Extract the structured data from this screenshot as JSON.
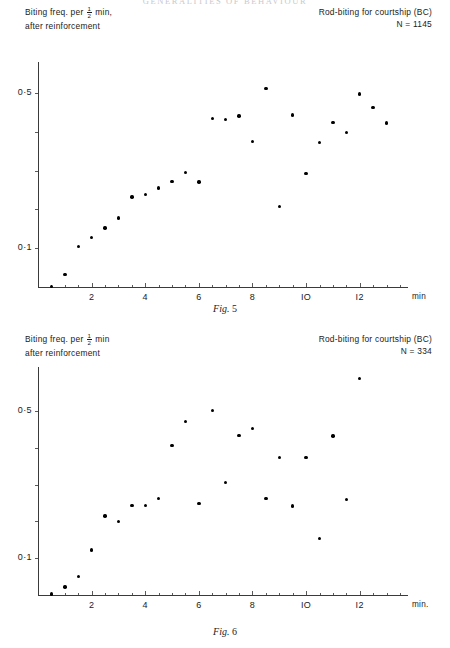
{
  "running_head": "GENERALITIES OF BEHAVIOUR",
  "figures": [
    {
      "id": "fig5",
      "caption_italic": "Fig.",
      "caption_number": "5",
      "header_left_line1_pre": "Biting freq. per",
      "header_left_line1_num": "1",
      "header_left_line1_den": "2",
      "header_left_line1_post": "min,",
      "header_left_line2": "after reinforcement",
      "header_right_line1": "Rod-biting for courtship (BC)",
      "header_right_line2": "N = 1145",
      "chart_data": {
        "type": "scatter",
        "title": "Rod-biting for courtship (BC)",
        "subtitle": "N = 1145",
        "ylabel": "Biting freq. per 1/2 min, after reinforcement",
        "xlabel": "min",
        "xlim": [
          0,
          13.8
        ],
        "ylim": [
          0,
          0.58
        ],
        "xticks": [
          2,
          4,
          6,
          8,
          10,
          12
        ],
        "xtick_labels": [
          "2",
          "4",
          "6",
          "8",
          "IO",
          "I2"
        ],
        "xminor_step": 0.5,
        "yticks": [
          0.1,
          0.2,
          0.3,
          0.4,
          0.5
        ],
        "ytick_labels": [
          "0·1",
          "",
          "",
          "",
          "0·5"
        ],
        "grid": false,
        "legend": false,
        "n": 1145,
        "points": [
          {
            "x": 0.5,
            "y": 0.002
          },
          {
            "x": 1.0,
            "y": 0.032
          },
          {
            "x": 1.5,
            "y": 0.104
          },
          {
            "x": 2.0,
            "y": 0.128
          },
          {
            "x": 2.5,
            "y": 0.152
          },
          {
            "x": 3.0,
            "y": 0.178
          },
          {
            "x": 3.5,
            "y": 0.232
          },
          {
            "x": 4.0,
            "y": 0.238
          },
          {
            "x": 4.5,
            "y": 0.255
          },
          {
            "x": 5.0,
            "y": 0.272
          },
          {
            "x": 5.5,
            "y": 0.295
          },
          {
            "x": 6.0,
            "y": 0.271
          },
          {
            "x": 6.5,
            "y": 0.435
          },
          {
            "x": 7.0,
            "y": 0.432
          },
          {
            "x": 7.5,
            "y": 0.441
          },
          {
            "x": 8.0,
            "y": 0.375
          },
          {
            "x": 8.5,
            "y": 0.512
          },
          {
            "x": 9.0,
            "y": 0.208
          },
          {
            "x": 9.5,
            "y": 0.443
          },
          {
            "x": 10.0,
            "y": 0.292
          },
          {
            "x": 10.5,
            "y": 0.372
          },
          {
            "x": 11.0,
            "y": 0.424
          },
          {
            "x": 11.5,
            "y": 0.398
          },
          {
            "x": 12.0,
            "y": 0.497
          },
          {
            "x": 12.5,
            "y": 0.463
          },
          {
            "x": 13.0,
            "y": 0.423
          }
        ]
      }
    },
    {
      "id": "fig6",
      "caption_italic": "Fig.",
      "caption_number": "6",
      "header_left_line1_pre": "Biting freq. per",
      "header_left_line1_num": "1",
      "header_left_line1_den": "2",
      "header_left_line1_post": "min",
      "header_left_line2": "after reinforcement",
      "header_right_line1": "Rod-biting for courtship (BC)",
      "header_right_line2": "N = 334",
      "chart_data": {
        "type": "scatter",
        "title": "Rod-biting for courtship (BC)",
        "subtitle": "N = 334",
        "ylabel": "Biting freq. per 1/2 min after reinforcement",
        "xlabel": "min.",
        "xlim": [
          0,
          13.8
        ],
        "ylim": [
          0,
          0.62
        ],
        "xticks": [
          2,
          4,
          6,
          8,
          10,
          12
        ],
        "xtick_labels": [
          "2",
          "4",
          "6",
          "8",
          "IO",
          "I2"
        ],
        "xminor_step": 0.5,
        "yticks": [
          0.1,
          0.2,
          0.3,
          0.4,
          0.5
        ],
        "ytick_labels": [
          "0·1",
          "",
          "",
          "",
          "0·5"
        ],
        "grid": false,
        "legend": false,
        "n": 334,
        "points": [
          {
            "x": 0.5,
            "y": 0.003
          },
          {
            "x": 1.0,
            "y": 0.022
          },
          {
            "x": 1.5,
            "y": 0.05
          },
          {
            "x": 2.0,
            "y": 0.122
          },
          {
            "x": 2.5,
            "y": 0.215
          },
          {
            "x": 3.0,
            "y": 0.2
          },
          {
            "x": 3.5,
            "y": 0.244
          },
          {
            "x": 4.0,
            "y": 0.244
          },
          {
            "x": 4.5,
            "y": 0.262
          },
          {
            "x": 5.0,
            "y": 0.406
          },
          {
            "x": 5.5,
            "y": 0.472
          },
          {
            "x": 6.0,
            "y": 0.248
          },
          {
            "x": 6.5,
            "y": 0.502
          },
          {
            "x": 7.0,
            "y": 0.306
          },
          {
            "x": 7.5,
            "y": 0.434
          },
          {
            "x": 8.0,
            "y": 0.452
          },
          {
            "x": 8.5,
            "y": 0.262
          },
          {
            "x": 9.0,
            "y": 0.374
          },
          {
            "x": 9.5,
            "y": 0.242
          },
          {
            "x": 10.0,
            "y": 0.374
          },
          {
            "x": 10.5,
            "y": 0.153
          },
          {
            "x": 11.0,
            "y": 0.432
          },
          {
            "x": 11.5,
            "y": 0.26
          },
          {
            "x": 12.0,
            "y": 0.588
          }
        ]
      }
    }
  ]
}
